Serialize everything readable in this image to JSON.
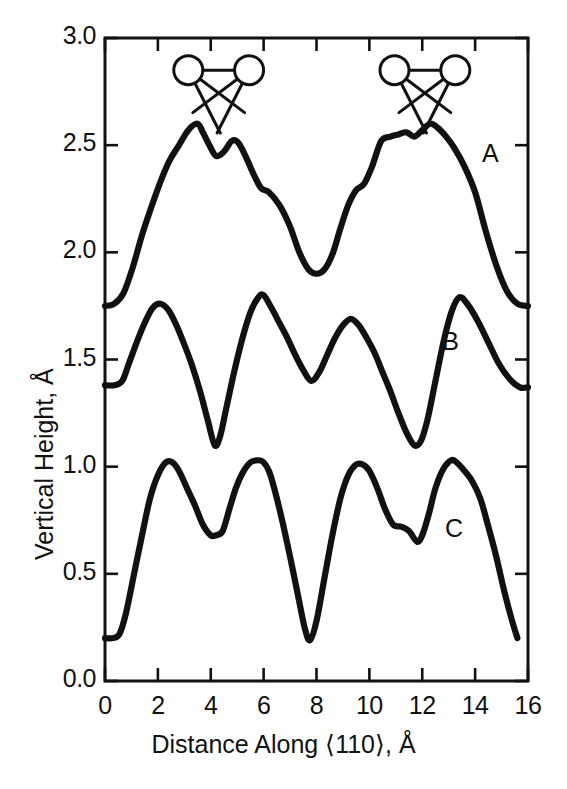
{
  "chart_data": {
    "type": "line",
    "title": "",
    "xlabel": "Distance Along ⟨110⟩, Å",
    "ylabel": "Vertical Height, Å",
    "xlim": [
      0,
      16
    ],
    "ylim": [
      0.0,
      3.0
    ],
    "xticks": [
      0,
      2,
      4,
      6,
      8,
      10,
      12,
      14,
      16
    ],
    "xtick_labels": [
      "0",
      "2",
      "4",
      "6",
      "8",
      "10",
      "12",
      "14",
      "16"
    ],
    "yticks": [
      0.0,
      0.5,
      1.0,
      1.5,
      2.0,
      2.5,
      3.0
    ],
    "ytick_labels": [
      "0.0",
      "0.5",
      "1.0",
      "1.5",
      "2.0",
      "2.5",
      "3.0"
    ],
    "grid": false,
    "legend_position": "inline-right",
    "line_color": "#111111",
    "series": [
      {
        "name": "A",
        "label": "A",
        "label_x": 14.6,
        "label_y": 2.45,
        "x": [
          0.0,
          0.35,
          0.7,
          1.05,
          1.4,
          1.75,
          2.1,
          2.45,
          2.8,
          3.15,
          3.5,
          3.7,
          3.95,
          4.2,
          4.5,
          4.8,
          5.05,
          5.35,
          5.6,
          5.9,
          6.2,
          6.6,
          7.0,
          7.35,
          7.7,
          8.0,
          8.3,
          8.6,
          8.9,
          9.2,
          9.5,
          9.8,
          10.1,
          10.45,
          10.8,
          11.1,
          11.4,
          11.7,
          12.0,
          12.3,
          12.6,
          12.9,
          13.2,
          13.6,
          14.0,
          14.4,
          14.8,
          15.2,
          15.6,
          16.0
        ],
        "y": [
          1.75,
          1.76,
          1.81,
          1.93,
          2.08,
          2.21,
          2.33,
          2.43,
          2.5,
          2.57,
          2.6,
          2.56,
          2.5,
          2.45,
          2.47,
          2.52,
          2.51,
          2.44,
          2.37,
          2.3,
          2.28,
          2.22,
          2.12,
          2.0,
          1.92,
          1.9,
          1.92,
          1.99,
          2.11,
          2.22,
          2.29,
          2.32,
          2.4,
          2.52,
          2.54,
          2.55,
          2.56,
          2.54,
          2.57,
          2.6,
          2.58,
          2.54,
          2.49,
          2.4,
          2.28,
          2.1,
          1.94,
          1.82,
          1.76,
          1.75
        ]
      },
      {
        "name": "B",
        "label": "B",
        "label_x": 13.1,
        "label_y": 1.57,
        "x": [
          0.0,
          0.35,
          0.65,
          0.9,
          1.2,
          1.5,
          1.8,
          2.1,
          2.4,
          2.7,
          3.0,
          3.3,
          3.6,
          3.9,
          4.15,
          4.35,
          4.6,
          4.9,
          5.2,
          5.5,
          5.8,
          6.0,
          6.3,
          6.6,
          6.9,
          7.2,
          7.5,
          7.8,
          8.1,
          8.4,
          8.7,
          9.0,
          9.3,
          9.6,
          9.9,
          10.2,
          10.5,
          10.8,
          11.1,
          11.4,
          11.7,
          11.95,
          12.2,
          12.5,
          12.8,
          13.1,
          13.4,
          13.7,
          14.1,
          14.5,
          14.9,
          15.3,
          15.7,
          16.0
        ],
        "y": [
          1.38,
          1.38,
          1.4,
          1.48,
          1.58,
          1.67,
          1.74,
          1.76,
          1.73,
          1.66,
          1.57,
          1.47,
          1.35,
          1.21,
          1.1,
          1.14,
          1.28,
          1.45,
          1.6,
          1.72,
          1.79,
          1.8,
          1.74,
          1.67,
          1.6,
          1.52,
          1.45,
          1.4,
          1.44,
          1.52,
          1.6,
          1.66,
          1.69,
          1.66,
          1.6,
          1.53,
          1.44,
          1.35,
          1.25,
          1.16,
          1.1,
          1.12,
          1.22,
          1.4,
          1.58,
          1.72,
          1.79,
          1.76,
          1.68,
          1.58,
          1.48,
          1.41,
          1.37,
          1.37
        ]
      },
      {
        "name": "C",
        "label": "C",
        "label_x": 13.2,
        "label_y": 0.7,
        "x": [
          0.0,
          0.3,
          0.55,
          0.8,
          1.1,
          1.4,
          1.7,
          2.0,
          2.3,
          2.55,
          2.8,
          3.1,
          3.4,
          3.7,
          4.0,
          4.2,
          4.45,
          4.7,
          4.95,
          5.2,
          5.5,
          5.8,
          6.0,
          6.2,
          6.4,
          6.7,
          7.0,
          7.3,
          7.55,
          7.75,
          8.0,
          8.3,
          8.6,
          8.9,
          9.2,
          9.5,
          9.75,
          10.0,
          10.3,
          10.6,
          10.9,
          11.2,
          11.5,
          11.8,
          12.0,
          12.25,
          12.5,
          12.8,
          13.1,
          13.3,
          13.6,
          13.9,
          14.2,
          14.5,
          14.8,
          15.1,
          15.4,
          15.6
        ],
        "y": [
          0.2,
          0.2,
          0.22,
          0.32,
          0.5,
          0.68,
          0.85,
          0.96,
          1.02,
          1.02,
          0.98,
          0.9,
          0.82,
          0.73,
          0.68,
          0.68,
          0.7,
          0.8,
          0.9,
          0.97,
          1.02,
          1.03,
          1.02,
          0.98,
          0.9,
          0.75,
          0.58,
          0.4,
          0.25,
          0.19,
          0.28,
          0.48,
          0.68,
          0.85,
          0.96,
          1.01,
          1.01,
          0.98,
          0.9,
          0.8,
          0.73,
          0.72,
          0.7,
          0.65,
          0.68,
          0.78,
          0.9,
          0.99,
          1.03,
          1.02,
          0.98,
          0.93,
          0.85,
          0.72,
          0.58,
          0.42,
          0.28,
          0.2
        ]
      }
    ],
    "annotations": {
      "dimers": [
        {
          "name": "dimer-left",
          "atom1_x": 3.15,
          "atom2_x": 5.45,
          "y": 2.85
        },
        {
          "name": "dimer-right",
          "atom1_x": 10.95,
          "atom2_x": 13.25,
          "y": 2.85
        }
      ]
    }
  }
}
